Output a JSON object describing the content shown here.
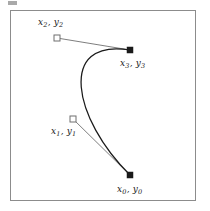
{
  "figure": {
    "kind": "cubic-bezier-control-point-diagram",
    "background_color": "#ffffff",
    "frame": {
      "border_color": "#8c8c8c",
      "x": 10,
      "y": 10,
      "width": 186,
      "height": 191
    },
    "curve_color": "#1a1a1a",
    "tangent_line_color": "#6f6f6f",
    "anchor_marker": {
      "shape": "filled-square",
      "fill": "#1a1a1a",
      "size": 6
    },
    "control_marker": {
      "shape": "open-square",
      "stroke": "#6f6f6f",
      "fill": "#ffffff",
      "size": 6
    },
    "points": [
      {
        "id": "p0",
        "role": "anchor",
        "marker": "filled-square",
        "label_x": "x",
        "label_x_sub": "0",
        "label_y": "y",
        "label_y_sub": "0",
        "separator": ", ",
        "x": 130,
        "y": 175
      },
      {
        "id": "p1",
        "role": "control",
        "marker": "open-square",
        "label_x": "x",
        "label_x_sub": "1",
        "label_y": "y",
        "label_y_sub": "1",
        "separator": ", ",
        "x": 73,
        "y": 119
      },
      {
        "id": "p2",
        "role": "control",
        "marker": "open-square",
        "label_x": "x",
        "label_x_sub": "2",
        "label_y": "y",
        "label_y_sub": "2",
        "separator": ", ",
        "x": 57,
        "y": 38
      },
      {
        "id": "p3",
        "role": "anchor",
        "marker": "filled-square",
        "label_x": "x",
        "label_x_sub": "3",
        "label_y": "y",
        "label_y_sub": "3",
        "separator": ", ",
        "x": 130,
        "y": 50
      }
    ],
    "curve_path": "M 130 175 C 73 119 57 38 130 50",
    "tangent_segments": [
      {
        "from": "p0",
        "to": "p1",
        "x1": 130,
        "y1": 175,
        "x2": 73,
        "y2": 119
      },
      {
        "from": "p2",
        "to": "p3",
        "x1": 57,
        "y1": 38,
        "x2": 130,
        "y2": 50
      }
    ]
  },
  "labels": {
    "p0": "x0, y0",
    "p1": "x1, y1",
    "p2": "x2, y2",
    "p3": "x3, y3"
  }
}
